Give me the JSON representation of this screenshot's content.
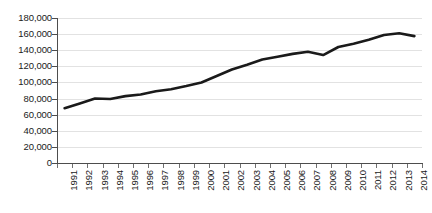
{
  "chart_data": {
    "type": "line",
    "title": "",
    "subtitle": "",
    "xlabel": "",
    "ylabel": "",
    "grid": true,
    "legend": false,
    "legend_position": "none",
    "line_color": "#1a1a1a",
    "gridline_color": "#e2e2e2",
    "axis_color": "#4d4d4d",
    "xlim": [
      1991,
      2014
    ],
    "ylim": [
      0,
      180000
    ],
    "y_tick_interval": 20000,
    "y_tick_labels": [
      "180,000",
      "160,000",
      "140,000",
      "120,000",
      "100,000",
      "80,000",
      "60,000",
      "40,000",
      "20,000",
      "0"
    ],
    "y_tick_values": [
      180000,
      160000,
      140000,
      120000,
      100000,
      80000,
      60000,
      40000,
      20000,
      0
    ],
    "categories": [
      "1991",
      "1992",
      "1993",
      "1994",
      "1995",
      "1996",
      "1997",
      "1998",
      "1999",
      "2000",
      "2001",
      "2002",
      "2003",
      "2004",
      "2005",
      "2006",
      "2007",
      "2008",
      "2009",
      "2010",
      "2011",
      "2012",
      "2013",
      "2014"
    ],
    "values": [
      68000,
      74000,
      80000,
      79500,
      83000,
      85000,
      89000,
      91500,
      95500,
      100000,
      108000,
      116000,
      122000,
      128500,
      132000,
      135500,
      138000,
      134000,
      144000,
      148000,
      153000,
      159000,
      161000,
      157500
    ]
  }
}
